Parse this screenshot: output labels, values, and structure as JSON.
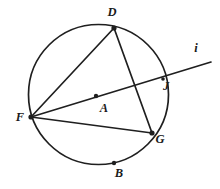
{
  "figure": {
    "type": "circle-geometry-diagram",
    "background_color": "#ffffff",
    "stroke_color": "#1f1f1f",
    "width": 220,
    "height": 189
  },
  "circle": {
    "name": "circle-A",
    "center_label": "A",
    "cx": 98.5,
    "cy": 94.5,
    "r": 70
  },
  "points": [
    {
      "id": "D",
      "label": "D",
      "x": 114,
      "y": 28,
      "label_x": 112,
      "label_y": 16,
      "on_circle": true,
      "is_vertex": true
    },
    {
      "id": "F",
      "label": "F",
      "x": 31,
      "y": 117,
      "label_x": 20,
      "label_y": 121,
      "on_circle": true,
      "is_vertex": true
    },
    {
      "id": "G",
      "label": "G",
      "x": 152,
      "y": 133,
      "label_x": 160,
      "label_y": 143,
      "on_circle": true,
      "is_vertex": true
    },
    {
      "id": "J",
      "label": "J",
      "x": 163,
      "y": 79,
      "label_x": 166,
      "label_y": 90,
      "on_circle": true,
      "is_vertex": false
    },
    {
      "id": "A",
      "label": "A",
      "x": 96,
      "y": 96,
      "label_x": 104,
      "label_y": 112,
      "on_circle": false,
      "is_vertex": false
    },
    {
      "id": "B",
      "label": "B",
      "x": 114,
      "y": 163,
      "label_x": 119,
      "label_y": 177,
      "on_circle": true,
      "is_vertex": false
    }
  ],
  "segments": [
    {
      "name": "chord-FD",
      "from": "F",
      "to": "D",
      "x1": 31,
      "y1": 117,
      "x2": 114,
      "y2": 28
    },
    {
      "name": "chord-FG",
      "from": "F",
      "to": "G",
      "x1": 31,
      "y1": 117,
      "x2": 152,
      "y2": 133
    },
    {
      "name": "chord-DG",
      "from": "D",
      "to": "G",
      "x1": 114,
      "y1": 28,
      "x2": 152,
      "y2": 133
    }
  ],
  "lines": [
    {
      "name": "secant-line-i",
      "label": "i",
      "label_x": 196,
      "label_y": 52,
      "x1": 31,
      "y1": 117,
      "x2": 211,
      "y2": 62,
      "passes_through": [
        "F",
        "A",
        "J"
      ]
    }
  ]
}
